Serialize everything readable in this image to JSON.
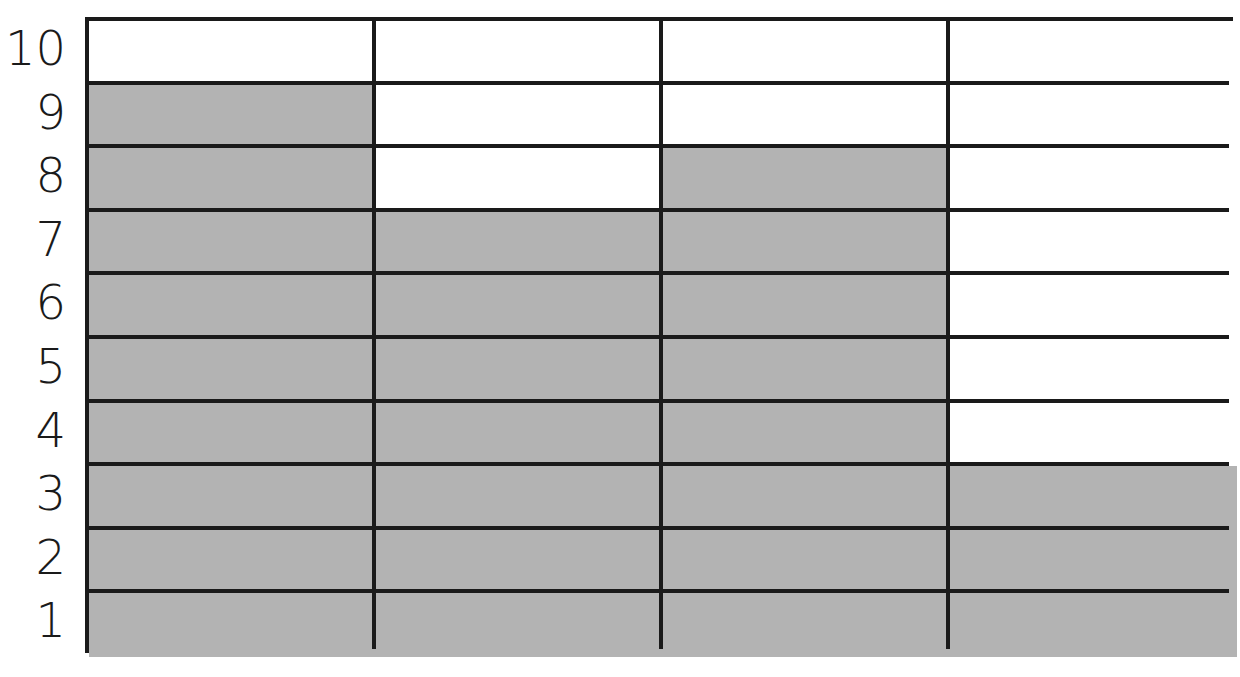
{
  "chart_data": {
    "type": "bar",
    "title": "",
    "xlabel": "",
    "ylabel": "",
    "categories": [
      "Column 1",
      "Column 2",
      "Column 3",
      "Column 4"
    ],
    "values": [
      9,
      7,
      8,
      3
    ],
    "y_ticks": [
      "1",
      "2",
      "3",
      "4",
      "5",
      "6",
      "7",
      "8",
      "9",
      "10"
    ],
    "ylim": [
      0,
      10
    ],
    "grid": true,
    "legend": "none",
    "style": "shaded grid cells (bar graph worksheet)"
  },
  "colors": {
    "filled": "#b3b3b3",
    "empty": "#ffffff",
    "line": "#1a1a1a"
  }
}
